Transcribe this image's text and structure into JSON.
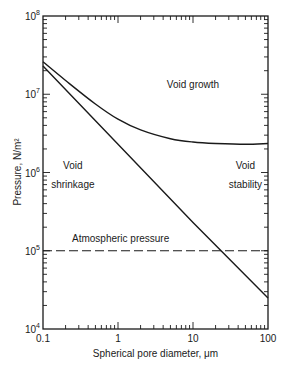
{
  "chart_data": {
    "type": "line",
    "title": "",
    "xlabel": "Spherical pore diameter, μm",
    "ylabel": "Pressure, N/m²",
    "xscale": "log",
    "yscale": "log",
    "xlim": [
      0.1,
      100
    ],
    "ylim": [
      10000,
      100000000
    ],
    "grid": false,
    "x_ticks": [
      {
        "value": 0.1,
        "label": "0.1"
      },
      {
        "value": 1,
        "label": "1"
      },
      {
        "value": 10,
        "label": "10"
      },
      {
        "value": 100,
        "label": "100"
      }
    ],
    "y_ticks": [
      {
        "value": 100000000,
        "base": "10",
        "exp": "8"
      },
      {
        "value": 10000000,
        "base": "10",
        "exp": "7"
      },
      {
        "value": 1000000,
        "base": "10",
        "exp": "6"
      },
      {
        "value": 100000,
        "base": "10",
        "exp": "5"
      },
      {
        "value": 10000,
        "base": "10",
        "exp": "4"
      }
    ],
    "series": [
      {
        "name": "Void growth / stability boundary (upper curve)",
        "style": "solid",
        "x": [
          0.1,
          0.2,
          0.5,
          1,
          2,
          5,
          10,
          20,
          50,
          100
        ],
        "values": [
          26000000,
          15000000,
          7500000,
          4800000,
          3500000,
          2700000,
          2450000,
          2350000,
          2300000,
          2350000
        ]
      },
      {
        "name": "Void shrinkage boundary (lower line)",
        "style": "solid",
        "x": [
          0.1,
          1,
          10,
          100
        ],
        "values": [
          23000000,
          2300000,
          230000,
          25000
        ]
      },
      {
        "name": "Atmospheric pressure",
        "style": "dashed",
        "x": [
          0.1,
          100
        ],
        "values": [
          100000,
          100000
        ]
      }
    ],
    "annotations": [
      {
        "text": "Void growth",
        "x": 10,
        "y": 13000000
      },
      {
        "text": "Void",
        "x": 0.25,
        "y": 1200000
      },
      {
        "text": "shrinkage",
        "x": 0.25,
        "y": 700000
      },
      {
        "text": "Void",
        "x": 50,
        "y": 1200000
      },
      {
        "text": "stability",
        "x": 50,
        "y": 700000
      },
      {
        "text": "Atmospheric pressure",
        "x": 0.8,
        "y": 140000
      }
    ]
  }
}
